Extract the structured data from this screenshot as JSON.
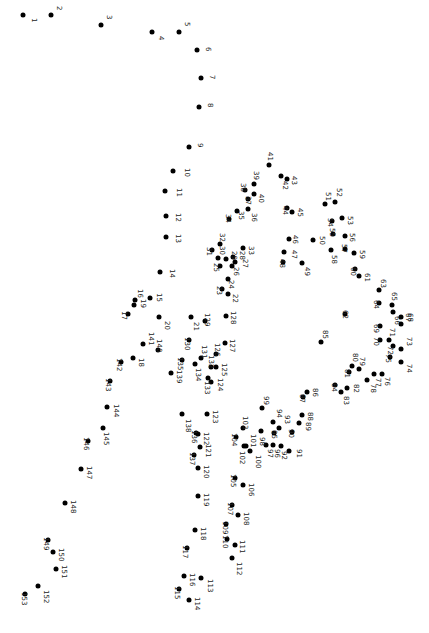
{
  "puzzle": {
    "type": "connect-the-dots",
    "total_dots": 153,
    "label_rotation_deg": 90,
    "dots": [
      {
        "n": 1,
        "x": 23,
        "y": 15,
        "lx": 30,
        "ly": 18
      },
      {
        "n": 2,
        "x": 51,
        "y": 15,
        "lx": 55,
        "ly": 6
      },
      {
        "n": 3,
        "x": 101,
        "y": 25,
        "lx": 105,
        "ly": 15
      },
      {
        "n": 4,
        "x": 152,
        "y": 32,
        "lx": 157,
        "ly": 36
      },
      {
        "n": 5,
        "x": 179,
        "y": 32,
        "lx": 183,
        "ly": 22
      },
      {
        "n": 6,
        "x": 197,
        "y": 50,
        "lx": 204,
        "ly": 47
      },
      {
        "n": 7,
        "x": 201,
        "y": 78,
        "lx": 208,
        "ly": 75
      },
      {
        "n": 8,
        "x": 199,
        "y": 107,
        "lx": 206,
        "ly": 103
      },
      {
        "n": 9,
        "x": 189,
        "y": 147,
        "lx": 196,
        "ly": 143
      },
      {
        "n": 10,
        "x": 173,
        "y": 171,
        "lx": 183,
        "ly": 168
      },
      {
        "n": 11,
        "x": 165,
        "y": 191,
        "lx": 175,
        "ly": 188
      },
      {
        "n": 12,
        "x": 166,
        "y": 216,
        "lx": 174,
        "ly": 213
      },
      {
        "n": 13,
        "x": 166,
        "y": 237,
        "lx": 174,
        "ly": 234
      },
      {
        "n": 14,
        "x": 160,
        "y": 272,
        "lx": 168,
        "ly": 269
      },
      {
        "n": 15,
        "x": 150,
        "y": 298,
        "lx": 155,
        "ly": 293
      },
      {
        "n": 16,
        "x": 135,
        "y": 300,
        "lx": 136,
        "ly": 289
      },
      {
        "n": 17,
        "x": 128,
        "y": 314,
        "lx": 120,
        "ly": 311
      },
      {
        "n": 18,
        "x": 133,
        "y": 358,
        "lx": 137,
        "ly": 358
      },
      {
        "n": 19,
        "x": 134,
        "y": 305,
        "lx": 139,
        "ly": 299
      },
      {
        "n": 20,
        "x": 159,
        "y": 317,
        "lx": 163,
        "ly": 321
      },
      {
        "n": 21,
        "x": 191,
        "y": 317,
        "lx": 192,
        "ly": 322
      },
      {
        "n": 22,
        "x": 228,
        "y": 294,
        "lx": 231,
        "ly": 294
      },
      {
        "n": 23,
        "x": 222,
        "y": 289,
        "lx": 215,
        "ly": 286
      },
      {
        "n": 24,
        "x": 228,
        "y": 279,
        "lx": 227,
        "ly": 280
      },
      {
        "n": 25,
        "x": 220,
        "y": 266,
        "lx": 212,
        "ly": 263
      },
      {
        "n": 26,
        "x": 232,
        "y": 266,
        "lx": 232,
        "ly": 267
      },
      {
        "n": 27,
        "x": 235,
        "y": 262,
        "lx": 241,
        "ly": 259
      },
      {
        "n": 28,
        "x": 233,
        "y": 257,
        "lx": 238,
        "ly": 251
      },
      {
        "n": 29,
        "x": 226,
        "y": 259,
        "lx": 230,
        "ly": 251
      },
      {
        "n": 30,
        "x": 218,
        "y": 258,
        "lx": 218,
        "ly": 246
      },
      {
        "n": 31,
        "x": 212,
        "y": 250,
        "lx": 205,
        "ly": 247
      },
      {
        "n": 32,
        "x": 220,
        "y": 244,
        "lx": 218,
        "ly": 233
      },
      {
        "n": 33,
        "x": 243,
        "y": 248,
        "lx": 247,
        "ly": 246
      },
      {
        "n": 34,
        "x": 229,
        "y": 219,
        "lx": 224,
        "ly": 214
      },
      {
        "n": 35,
        "x": 237,
        "y": 211,
        "lx": 237,
        "ly": 211
      },
      {
        "n": 36,
        "x": 248,
        "y": 209,
        "lx": 250,
        "ly": 213
      },
      {
        "n": 37,
        "x": 248,
        "y": 199,
        "lx": 244,
        "ly": 196
      },
      {
        "n": 38,
        "x": 245,
        "y": 190,
        "lx": 239,
        "ly": 183
      },
      {
        "n": 39,
        "x": 254,
        "y": 184,
        "lx": 252,
        "ly": 171
      },
      {
        "n": 40,
        "x": 254,
        "y": 194,
        "lx": 257,
        "ly": 194
      },
      {
        "n": 41,
        "x": 269,
        "y": 165,
        "lx": 266,
        "ly": 152
      },
      {
        "n": 42,
        "x": 281,
        "y": 176,
        "lx": 281,
        "ly": 181
      },
      {
        "n": 43,
        "x": 287,
        "y": 179,
        "lx": 290,
        "ly": 176
      },
      {
        "n": 44,
        "x": 287,
        "y": 208,
        "lx": 281,
        "ly": 206
      },
      {
        "n": 45,
        "x": 292,
        "y": 212,
        "lx": 296,
        "ly": 208
      },
      {
        "n": 46,
        "x": 289,
        "y": 239,
        "lx": 291,
        "ly": 235
      },
      {
        "n": 47,
        "x": 284,
        "y": 252,
        "lx": 290,
        "ly": 250
      },
      {
        "n": 48,
        "x": 283,
        "y": 262,
        "lx": 278,
        "ly": 259
      },
      {
        "n": 49,
        "x": 302,
        "y": 263,
        "lx": 303,
        "ly": 267
      },
      {
        "n": 50,
        "x": 313,
        "y": 240,
        "lx": 318,
        "ly": 236
      },
      {
        "n": 51,
        "x": 325,
        "y": 204,
        "lx": 324,
        "ly": 192
      },
      {
        "n": 52,
        "x": 335,
        "y": 202,
        "lx": 335,
        "ly": 188
      },
      {
        "n": 53,
        "x": 342,
        "y": 218,
        "lx": 346,
        "ly": 216
      },
      {
        "n": 54,
        "x": 332,
        "y": 221,
        "lx": 326,
        "ly": 218
      },
      {
        "n": 55,
        "x": 333,
        "y": 234,
        "lx": 328,
        "ly": 228
      },
      {
        "n": 56,
        "x": 345,
        "y": 236,
        "lx": 348,
        "ly": 233
      },
      {
        "n": 57,
        "x": 345,
        "y": 249,
        "lx": 340,
        "ly": 244
      },
      {
        "n": 58,
        "x": 331,
        "y": 250,
        "lx": 330,
        "ly": 255
      },
      {
        "n": 59,
        "x": 354,
        "y": 253,
        "lx": 358,
        "ly": 250
      },
      {
        "n": 60,
        "x": 355,
        "y": 269,
        "lx": 349,
        "ly": 267
      },
      {
        "n": 61,
        "x": 359,
        "y": 276,
        "lx": 363,
        "ly": 273
      },
      {
        "n": 62,
        "x": 345,
        "y": 314,
        "lx": 341,
        "ly": 310
      },
      {
        "n": 63,
        "x": 379,
        "y": 290,
        "lx": 379,
        "ly": 279
      },
      {
        "n": 64,
        "x": 379,
        "y": 303,
        "lx": 372,
        "ly": 300
      },
      {
        "n": 65,
        "x": 392,
        "y": 305,
        "lx": 390,
        "ly": 292
      },
      {
        "n": 66,
        "x": 393,
        "y": 312,
        "lx": 393,
        "ly": 316
      },
      {
        "n": 67,
        "x": 401,
        "y": 317,
        "lx": 404,
        "ly": 313
      },
      {
        "n": 68,
        "x": 401,
        "y": 324,
        "lx": 406,
        "ly": 313
      },
      {
        "n": 69,
        "x": 380,
        "y": 326,
        "lx": 372,
        "ly": 324
      },
      {
        "n": 70,
        "x": 380,
        "y": 340,
        "lx": 372,
        "ly": 337
      },
      {
        "n": 71,
        "x": 389,
        "y": 340,
        "lx": 388,
        "ly": 328
      },
      {
        "n": 72,
        "x": 393,
        "y": 346,
        "lx": 386,
        "ly": 346
      },
      {
        "n": 73,
        "x": 401,
        "y": 349,
        "lx": 405,
        "ly": 337
      },
      {
        "n": 74,
        "x": 401,
        "y": 362,
        "lx": 405,
        "ly": 364
      },
      {
        "n": 75,
        "x": 390,
        "y": 357,
        "lx": 384,
        "ly": 354
      },
      {
        "n": 76,
        "x": 382,
        "y": 374,
        "lx": 383,
        "ly": 377
      },
      {
        "n": 77,
        "x": 374,
        "y": 374,
        "lx": 374,
        "ly": 378
      },
      {
        "n": 78,
        "x": 367,
        "y": 380,
        "lx": 369,
        "ly": 384
      },
      {
        "n": 79,
        "x": 359,
        "y": 369,
        "lx": 358,
        "ly": 357
      },
      {
        "n": 80,
        "x": 352,
        "y": 366,
        "lx": 351,
        "ly": 353
      },
      {
        "n": 81,
        "x": 349,
        "y": 372,
        "lx": 343,
        "ly": 369
      },
      {
        "n": 82,
        "x": 347,
        "y": 388,
        "lx": 352,
        "ly": 384
      },
      {
        "n": 83,
        "x": 341,
        "y": 392,
        "lx": 342,
        "ly": 396
      },
      {
        "n": 84,
        "x": 335,
        "y": 385,
        "lx": 330,
        "ly": 383
      },
      {
        "n": 85,
        "x": 321,
        "y": 342,
        "lx": 321,
        "ly": 330
      },
      {
        "n": 86,
        "x": 307,
        "y": 392,
        "lx": 311,
        "ly": 388
      },
      {
        "n": 87,
        "x": 303,
        "y": 397,
        "lx": 298,
        "ly": 394
      },
      {
        "n": 88,
        "x": 302,
        "y": 415,
        "lx": 306,
        "ly": 412
      },
      {
        "n": 89,
        "x": 299,
        "y": 423,
        "lx": 304,
        "ly": 422
      },
      {
        "n": 90,
        "x": 292,
        "y": 432,
        "lx": 287,
        "ly": 429
      },
      {
        "n": 91,
        "x": 289,
        "y": 451,
        "lx": 295,
        "ly": 449
      },
      {
        "n": 92,
        "x": 281,
        "y": 446,
        "lx": 280,
        "ly": 451
      },
      {
        "n": 93,
        "x": 279,
        "y": 428,
        "lx": 283,
        "ly": 415
      },
      {
        "n": 94,
        "x": 273,
        "y": 422,
        "lx": 275,
        "ly": 409
      },
      {
        "n": 95,
        "x": 274,
        "y": 433,
        "lx": 270,
        "ly": 430
      },
      {
        "n": 96,
        "x": 273,
        "y": 445,
        "lx": 273,
        "ly": 449
      },
      {
        "n": 97,
        "x": 266,
        "y": 445,
        "lx": 266,
        "ly": 449
      },
      {
        "n": 98,
        "x": 261,
        "y": 431,
        "lx": 258,
        "ly": 437
      },
      {
        "n": 99,
        "x": 262,
        "y": 408,
        "lx": 262,
        "ly": 396
      },
      {
        "n": 100,
        "x": 250,
        "y": 451,
        "lx": 254,
        "ly": 455
      },
      {
        "n": 101,
        "x": 246,
        "y": 446,
        "lx": 249,
        "ly": 434
      },
      {
        "n": 102,
        "x": 244,
        "y": 446,
        "lx": 238,
        "ly": 451
      },
      {
        "n": 103,
        "x": 243,
        "y": 428,
        "lx": 241,
        "ly": 416
      },
      {
        "n": 104,
        "x": 236,
        "y": 437,
        "lx": 230,
        "ly": 433
      },
      {
        "n": 105,
        "x": 235,
        "y": 478,
        "lx": 229,
        "ly": 474
      },
      {
        "n": 106,
        "x": 243,
        "y": 485,
        "lx": 247,
        "ly": 483
      },
      {
        "n": 107,
        "x": 232,
        "y": 505,
        "lx": 226,
        "ly": 502
      },
      {
        "n": 108,
        "x": 238,
        "y": 515,
        "lx": 242,
        "ly": 512
      },
      {
        "n": 109,
        "x": 226,
        "y": 524,
        "lx": 221,
        "ly": 521
      },
      {
        "n": 110,
        "x": 227,
        "y": 539,
        "lx": 221,
        "ly": 535
      },
      {
        "n": 111,
        "x": 235,
        "y": 545,
        "lx": 238,
        "ly": 540
      },
      {
        "n": 112,
        "x": 232,
        "y": 558,
        "lx": 235,
        "ly": 562
      },
      {
        "n": 113,
        "x": 201,
        "y": 578,
        "lx": 206,
        "ly": 579
      },
      {
        "n": 114,
        "x": 189,
        "y": 600,
        "lx": 193,
        "ly": 597
      },
      {
        "n": 115,
        "x": 179,
        "y": 589,
        "lx": 173,
        "ly": 586
      },
      {
        "n": 116,
        "x": 184,
        "y": 576,
        "lx": 188,
        "ly": 573
      },
      {
        "n": 117,
        "x": 187,
        "y": 548,
        "lx": 181,
        "ly": 545
      },
      {
        "n": 118,
        "x": 195,
        "y": 530,
        "lx": 199,
        "ly": 527
      },
      {
        "n": 119,
        "x": 198,
        "y": 496,
        "lx": 202,
        "ly": 493
      },
      {
        "n": 120,
        "x": 198,
        "y": 468,
        "lx": 202,
        "ly": 465
      },
      {
        "n": 121,
        "x": 200,
        "y": 447,
        "lx": 204,
        "ly": 444
      },
      {
        "n": 122,
        "x": 198,
        "y": 434,
        "lx": 202,
        "ly": 432
      },
      {
        "n": 123,
        "x": 207,
        "y": 414,
        "lx": 211,
        "ly": 410
      },
      {
        "n": 124,
        "x": 211,
        "y": 382,
        "lx": 216,
        "ly": 378
      },
      {
        "n": 125,
        "x": 216,
        "y": 367,
        "lx": 220,
        "ly": 363
      },
      {
        "n": 126,
        "x": 216,
        "y": 354,
        "lx": 213,
        "ly": 343
      },
      {
        "n": 127,
        "x": 225,
        "y": 343,
        "lx": 228,
        "ly": 339
      },
      {
        "n": 128,
        "x": 226,
        "y": 316,
        "lx": 229,
        "ly": 311
      },
      {
        "n": 129,
        "x": 205,
        "y": 321,
        "lx": 203,
        "ly": 313
      },
      {
        "n": 130,
        "x": 189,
        "y": 340,
        "lx": 183,
        "ly": 337
      },
      {
        "n": 131,
        "x": 201,
        "y": 358,
        "lx": 200,
        "ly": 345
      },
      {
        "n": 132,
        "x": 211,
        "y": 367,
        "lx": 207,
        "ly": 355
      },
      {
        "n": 133,
        "x": 208,
        "y": 378,
        "lx": 203,
        "ly": 381
      },
      {
        "n": 134,
        "x": 195,
        "y": 364,
        "lx": 194,
        "ly": 368
      },
      {
        "n": 135,
        "x": 182,
        "y": 360,
        "lx": 176,
        "ly": 357
      },
      {
        "n": 136,
        "x": 196,
        "y": 433,
        "lx": 190,
        "ly": 430
      },
      {
        "n": 137,
        "x": 194,
        "y": 455,
        "lx": 188,
        "ly": 452
      },
      {
        "n": 138,
        "x": 182,
        "y": 414,
        "lx": 184,
        "ly": 419
      },
      {
        "n": 139,
        "x": 171,
        "y": 373,
        "lx": 175,
        "ly": 370
      },
      {
        "n": 140,
        "x": 158,
        "y": 350,
        "lx": 155,
        "ly": 339
      },
      {
        "n": 141,
        "x": 143,
        "y": 344,
        "lx": 147,
        "ly": 332
      },
      {
        "n": 142,
        "x": 121,
        "y": 362,
        "lx": 115,
        "ly": 358
      },
      {
        "n": 143,
        "x": 110,
        "y": 381,
        "lx": 104,
        "ly": 378
      },
      {
        "n": 144,
        "x": 107,
        "y": 407,
        "lx": 112,
        "ly": 404
      },
      {
        "n": 145,
        "x": 103,
        "y": 428,
        "lx": 102,
        "ly": 432
      },
      {
        "n": 146,
        "x": 88,
        "y": 441,
        "lx": 82,
        "ly": 437
      },
      {
        "n": 147,
        "x": 81,
        "y": 469,
        "lx": 85,
        "ly": 466
      },
      {
        "n": 148,
        "x": 65,
        "y": 503,
        "lx": 69,
        "ly": 500
      },
      {
        "n": 149,
        "x": 48,
        "y": 540,
        "lx": 42,
        "ly": 537
      },
      {
        "n": 150,
        "x": 53,
        "y": 552,
        "lx": 57,
        "ly": 548
      },
      {
        "n": 151,
        "x": 56,
        "y": 569,
        "lx": 60,
        "ly": 565
      },
      {
        "n": 152,
        "x": 38,
        "y": 586,
        "lx": 42,
        "ly": 590
      },
      {
        "n": 153,
        "x": 25,
        "y": 594,
        "lx": 20,
        "ly": 592
      }
    ]
  }
}
